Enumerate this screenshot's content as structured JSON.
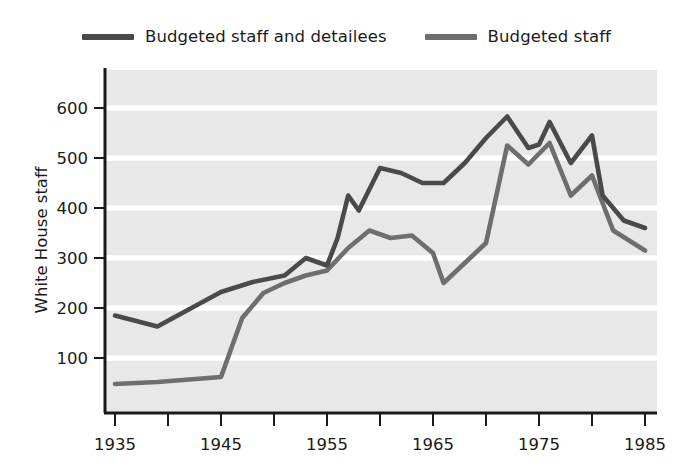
{
  "chart_data": {
    "type": "line",
    "title": "",
    "subtitle": "",
    "xlabel": "",
    "ylabel": "White House staff",
    "xlim": [
      1935,
      1985
    ],
    "ylim": [
      30,
      660
    ],
    "yticks": [
      100,
      200,
      300,
      400,
      500,
      600
    ],
    "ytick_labels": [
      "100",
      "200",
      "300",
      "400",
      "500",
      "600"
    ],
    "xticks": [
      1935,
      1940,
      1945,
      1950,
      1955,
      1960,
      1965,
      1970,
      1975,
      1980,
      1985
    ],
    "xtick_labels": [
      "1935",
      "",
      "1945",
      "",
      "1955",
      "",
      "1965",
      "",
      "1975",
      "",
      "1985"
    ],
    "xtick_labels_shown": [
      "1935",
      "1945",
      "1955",
      "1965",
      "1975",
      "1985"
    ],
    "grid": "horizontal",
    "grid_color": "#ffffff",
    "plot_background": "#e8e8e8",
    "legend_position": "top-center",
    "series": [
      {
        "name": "Budgeted staff and detailees",
        "color": "#4a4a4a",
        "x": [
          1935,
          1939,
          1945,
          1948,
          1951,
          1953,
          1955,
          1956,
          1957,
          1958,
          1960,
          1962,
          1964,
          1966,
          1968,
          1970,
          1972,
          1974,
          1975,
          1976,
          1978,
          1980,
          1981,
          1983,
          1985
        ],
        "values": [
          185,
          163,
          232,
          252,
          265,
          300,
          285,
          340,
          425,
          395,
          480,
          470,
          450,
          450,
          490,
          540,
          583,
          520,
          527,
          572,
          490,
          545,
          425,
          375,
          360
        ]
      },
      {
        "name": "Budgeted staff",
        "color": "#6e6e6e",
        "x": [
          1935,
          1939,
          1945,
          1947,
          1949,
          1951,
          1953,
          1955,
          1957,
          1959,
          1961,
          1963,
          1965,
          1966,
          1968,
          1970,
          1972,
          1974,
          1976,
          1978,
          1980,
          1982,
          1985
        ],
        "values": [
          48,
          52,
          62,
          180,
          230,
          250,
          265,
          275,
          320,
          355,
          340,
          345,
          310,
          250,
          290,
          330,
          525,
          487,
          530,
          425,
          465,
          355,
          315
        ]
      }
    ]
  }
}
